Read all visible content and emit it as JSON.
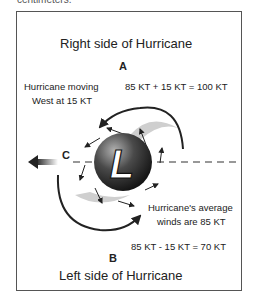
{
  "clipped_caption": "centimeters.",
  "diagram": {
    "title_right": "Right side of Hurricane",
    "label_a": "A",
    "moving_line1": "Hurricane moving",
    "moving_line2": "West at 15 KT",
    "equation_right": "85 KT + 15 KT = 100 KT",
    "label_c": "C",
    "center_letter": "L",
    "average_line1": "Hurricane's average",
    "average_line2": "winds are 85 KT",
    "equation_left": "85 KT - 15 KT = 70 KT",
    "label_b": "B",
    "title_left": "Left side of Hurricane"
  },
  "colors": {
    "frame": "#555555",
    "arrow": "#222222",
    "band": "#cccccc",
    "sphere_dark": "#1a1a1a",
    "sphere_light": "#9a9a9a"
  }
}
